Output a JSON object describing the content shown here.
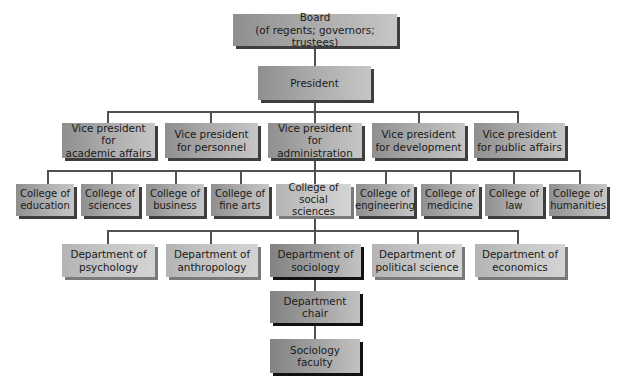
{
  "chart": {
    "board": "Board\n(of regents; governors; trustees)",
    "president": "President",
    "vice_presidents": [
      "Vice president for\nacademic affairs",
      "Vice president\nfor personnel",
      "Vice president for\nadministration",
      "Vice president\nfor development",
      "Vice president\nfor public affairs"
    ],
    "colleges": [
      "College of\neducation",
      "College of\nsciences",
      "College of\nbusiness",
      "College of\nfine arts",
      "College of\nsocial sciences",
      "College of\nengineering",
      "College of\nmedicine",
      "College of\nlaw",
      "College of\nhumanities"
    ],
    "departments": [
      "Department of\npsychology",
      "Department of\nanthropology",
      "Department of\nsociology",
      "Department of\npolitical science",
      "Department of\neconomics"
    ],
    "department_chair": "Department\nchair",
    "faculty": "Sociology\nfaculty"
  },
  "colors": {
    "connector": "#505050",
    "box_mid_gray": "#a9a9a9",
    "box_shadow": "#3e3e3e"
  }
}
